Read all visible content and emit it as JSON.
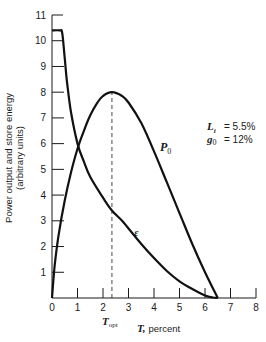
{
  "chart_data": {
    "type": "line",
    "title": "",
    "xlabel": "T, percent",
    "ylabel": "Power output and store energy (arbitrary units)",
    "xlim": [
      0,
      8
    ],
    "ylim": [
      0,
      11
    ],
    "x_ticks": [
      "0",
      "1",
      "2",
      "3",
      "4",
      "5",
      "6",
      "7",
      "8"
    ],
    "y_ticks": [
      "1",
      "2",
      "3",
      "4",
      "5",
      "6",
      "7",
      "8",
      "9",
      "10",
      "11"
    ],
    "grid": false,
    "legend": "none (curves labeled inline)",
    "series": [
      {
        "name": "P0",
        "label": "P",
        "label_sub": "0",
        "x": [
          0,
          0.1,
          0.25,
          0.5,
          0.75,
          1.0,
          1.25,
          1.5,
          1.75,
          2.0,
          2.35,
          2.75,
          3.0,
          3.5,
          4.0,
          4.5,
          5.0,
          5.5,
          6.0,
          6.5
        ],
        "values": [
          0,
          1.2,
          2.4,
          3.8,
          4.9,
          5.8,
          6.5,
          7.1,
          7.55,
          7.85,
          8.0,
          7.85,
          7.6,
          6.8,
          5.7,
          4.5,
          3.3,
          2.1,
          1.0,
          0
        ]
      },
      {
        "name": "epsilon",
        "label": "ε",
        "x": [
          0,
          0.3,
          0.4,
          0.5,
          0.6,
          0.75,
          1.0,
          1.25,
          1.5,
          2.0,
          2.35,
          2.75,
          3.0,
          3.5,
          4.0,
          4.5,
          5.0,
          5.5,
          6.0,
          6.3,
          6.5
        ],
        "values": [
          10.4,
          10.4,
          10.3,
          9.3,
          8.3,
          7.2,
          6.0,
          5.3,
          4.7,
          3.9,
          3.4,
          3.0,
          2.7,
          2.1,
          1.55,
          1.05,
          0.65,
          0.35,
          0.1,
          0.02,
          0
        ]
      }
    ],
    "annotations": [
      {
        "type": "vline",
        "x": 2.35,
        "from_y": 0,
        "to_y": 8,
        "style": "dashed",
        "label": "T_opt"
      },
      {
        "type": "text",
        "text": "Li = 5.5%"
      },
      {
        "type": "text",
        "text": "g0 = 12%"
      }
    ]
  },
  "labels": {
    "ylabel_line1": "Power output and store energy",
    "ylabel_line2": "(arbitrary units)",
    "xlabel_T": "T,",
    "xlabel_unit": "percent",
    "topt_main": "T",
    "topt_sub": "opt",
    "p0_main": "P",
    "p0_sub": "0",
    "eps": "ε",
    "li_main": "L",
    "li_sub": "i",
    "li_value": "=  5.5%",
    "g0_main": "g",
    "g0_sub": "0",
    "g0_value": "=  12%"
  }
}
